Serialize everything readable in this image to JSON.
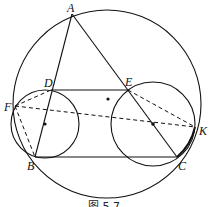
{
  "figure": {
    "caption": "图 5.7",
    "points": {
      "A": {
        "label": "A",
        "x": 72,
        "y": 14
      },
      "B": {
        "label": "B",
        "x": 35,
        "y": 157
      },
      "C": {
        "label": "C",
        "x": 177,
        "y": 157
      },
      "D": {
        "label": "D",
        "x": 51,
        "y": 90
      },
      "E": {
        "label": "E",
        "x": 128,
        "y": 90
      },
      "F": {
        "label": "F",
        "x": 15,
        "y": 106
      },
      "K": {
        "label": "K",
        "x": 195,
        "y": 127
      }
    },
    "circles": {
      "circumcircle": {
        "cx": 107,
        "cy": 104,
        "r": 94
      },
      "left_circle": {
        "cx": 45,
        "cy": 124,
        "r": 34
      },
      "right_circle": {
        "cx": 153,
        "cy": 124,
        "r": 42
      }
    },
    "centers": [
      {
        "x": 108,
        "y": 99
      },
      {
        "x": 45,
        "y": 124
      },
      {
        "x": 153,
        "y": 124
      }
    ],
    "solid_segments": [
      "AB",
      "AC",
      "BC",
      "DE"
    ],
    "dashed_segments": [
      "FD",
      "FB",
      "FK",
      "EK"
    ],
    "colors": {
      "stroke": "#111111",
      "background": "#ffffff"
    }
  }
}
